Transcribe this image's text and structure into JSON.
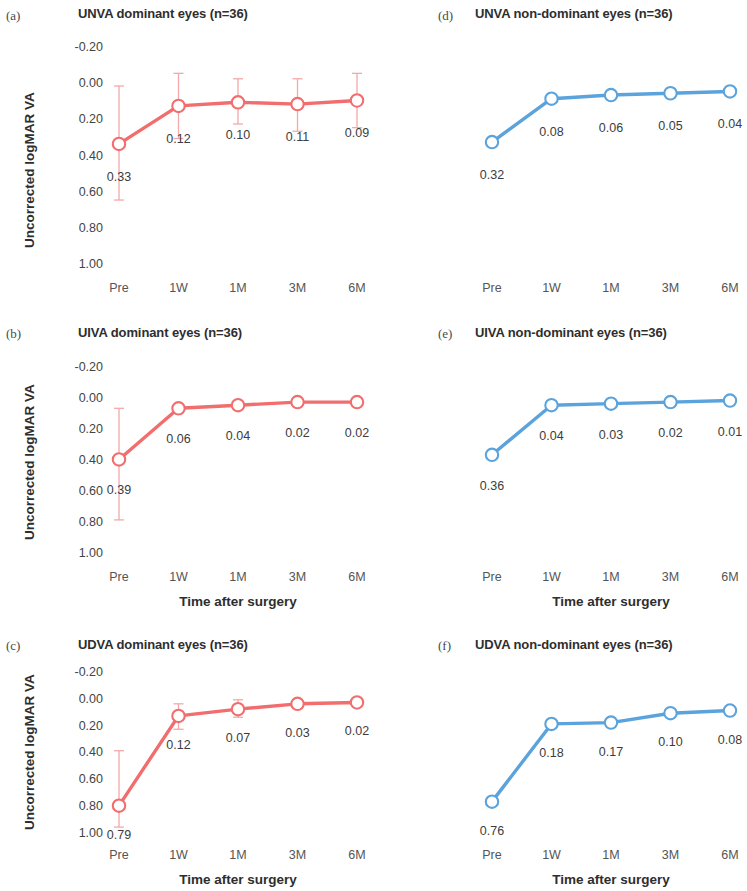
{
  "figure": {
    "y_axis_title": "Uncorrected logMAR VA",
    "x_axis_title": "Time after surgery",
    "y_ticks": [
      "-0.20",
      "0.00",
      "0.20",
      "0.40",
      "0.60",
      "0.80",
      "1.00"
    ],
    "x_ticks": [
      "Pre",
      "1W",
      "1M",
      "3M",
      "6M"
    ],
    "colors": {
      "dominant_series": "#F26D6D",
      "nondominant_series": "#5BA3DC",
      "errorbar_dominant": "#F3A9A9",
      "errorbar_nondominant": "#AFD2EC",
      "marker_fill": "#FFFFFF",
      "text": "#3a3a3a"
    }
  },
  "chart_data": [
    {
      "type": "line",
      "panel": "a",
      "panel_tag": "(a)",
      "title": "UNVA dominant eyes (n=36)",
      "series_name": "UNVA dominant eyes",
      "color": "#F26D6D",
      "categories": [
        "Pre",
        "1W",
        "1M",
        "3M",
        "6M"
      ],
      "values": [
        0.33,
        0.12,
        0.1,
        0.11,
        0.09
      ],
      "labels": [
        "0.33",
        "0.12",
        "0.10",
        "0.11",
        "0.09"
      ],
      "err_low": [
        0.64,
        0.3,
        0.22,
        0.26,
        0.24
      ],
      "err_high": [
        0.01,
        -0.06,
        -0.03,
        -0.03,
        -0.06
      ],
      "xlabel": "",
      "ylabel": "Uncorrected logMAR VA",
      "ylim": [
        -0.2,
        1.0
      ],
      "y_inverted": true,
      "grid": false,
      "legend": "none"
    },
    {
      "type": "line",
      "panel": "d",
      "panel_tag": "(d)",
      "title": "UNVA non-dominant eyes (n=36)",
      "series_name": "UNVA non-dominant eyes",
      "color": "#5BA3DC",
      "categories": [
        "Pre",
        "1W",
        "1M",
        "3M",
        "6M"
      ],
      "values": [
        0.32,
        0.08,
        0.06,
        0.05,
        0.04
      ],
      "labels": [
        "0.32",
        "0.08",
        "0.06",
        "0.05",
        "0.04"
      ],
      "err_low": [
        0.32,
        0.08,
        0.06,
        0.05,
        0.04
      ],
      "err_high": [
        0.32,
        0.08,
        0.06,
        0.05,
        0.04
      ],
      "xlabel": "",
      "ylabel": "",
      "ylim": [
        -0.2,
        1.0
      ],
      "y_inverted": true,
      "grid": false,
      "legend": "none"
    },
    {
      "type": "line",
      "panel": "b",
      "panel_tag": "(b)",
      "title": "UIVA dominant eyes (n=36)",
      "series_name": "UIVA dominant eyes",
      "color": "#F26D6D",
      "categories": [
        "Pre",
        "1W",
        "1M",
        "3M",
        "6M"
      ],
      "values": [
        0.39,
        0.06,
        0.04,
        0.02,
        0.02
      ],
      "labels": [
        "0.39",
        "0.06",
        "0.04",
        "0.02",
        "0.02"
      ],
      "err_low": [
        0.78,
        0.06,
        0.04,
        0.02,
        0.02
      ],
      "err_high": [
        0.06,
        0.06,
        0.04,
        0.02,
        0.02
      ],
      "xlabel": "Time after surgery",
      "ylabel": "Uncorrected logMAR VA",
      "ylim": [
        -0.2,
        1.0
      ],
      "y_inverted": true,
      "grid": false,
      "legend": "none"
    },
    {
      "type": "line",
      "panel": "e",
      "panel_tag": "(e)",
      "title": "UIVA non-dominant eyes (n=36)",
      "series_name": "UIVA non-dominant eyes",
      "color": "#5BA3DC",
      "categories": [
        "Pre",
        "1W",
        "1M",
        "3M",
        "6M"
      ],
      "values": [
        0.36,
        0.04,
        0.03,
        0.02,
        0.01
      ],
      "labels": [
        "0.36",
        "0.04",
        "0.03",
        "0.02",
        "0.01"
      ],
      "err_low": [
        0.36,
        0.04,
        0.03,
        0.02,
        0.01
      ],
      "err_high": [
        0.36,
        0.04,
        0.03,
        0.02,
        0.01
      ],
      "xlabel": "Time after surgery",
      "ylabel": "",
      "ylim": [
        -0.2,
        1.0
      ],
      "y_inverted": true,
      "grid": false,
      "legend": "none"
    },
    {
      "type": "line",
      "panel": "c",
      "panel_tag": "(c)",
      "title": "UDVA dominant eyes (n=36)",
      "series_name": "UDVA dominant eyes",
      "color": "#F26D6D",
      "categories": [
        "Pre",
        "1W",
        "1M",
        "3M",
        "6M"
      ],
      "values": [
        0.79,
        0.12,
        0.07,
        0.03,
        0.02
      ],
      "labels": [
        "0.79",
        "0.12",
        "0.07",
        "0.03",
        "0.02"
      ],
      "err_low": [
        0.95,
        0.22,
        0.13,
        0.03,
        0.02
      ],
      "err_high": [
        0.38,
        0.03,
        0.0,
        0.03,
        0.02
      ],
      "xlabel": "Time after surgery",
      "ylabel": "Uncorrected logMAR VA",
      "ylim": [
        -0.2,
        1.0
      ],
      "y_inverted": true,
      "grid": false,
      "legend": "none"
    },
    {
      "type": "line",
      "panel": "f",
      "panel_tag": "(f)",
      "title": "UDVA non-dominant eyes (n=36)",
      "series_name": "UDVA non-dominant eyes",
      "color": "#5BA3DC",
      "categories": [
        "Pre",
        "1W",
        "1M",
        "3M",
        "6M"
      ],
      "values": [
        0.76,
        0.18,
        0.17,
        0.1,
        0.08
      ],
      "labels": [
        "0.76",
        "0.18",
        "0.17",
        "0.10",
        "0.08"
      ],
      "err_low": [
        0.76,
        0.18,
        0.17,
        0.1,
        0.08
      ],
      "err_high": [
        0.76,
        0.18,
        0.17,
        0.1,
        0.08
      ],
      "xlabel": "Time after surgery",
      "ylabel": "",
      "ylim": [
        -0.2,
        1.0
      ],
      "y_inverted": true,
      "grid": false,
      "legend": "none"
    }
  ]
}
